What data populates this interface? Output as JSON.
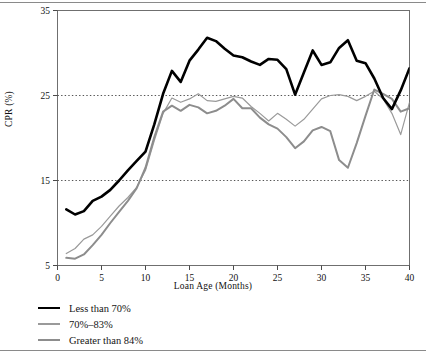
{
  "figure": {
    "background": "#ffffff",
    "frame_color": "#6f6f6f"
  },
  "axes": {
    "ylabel": "CPR (%)",
    "xlabel": "Loan Age (Months)",
    "y_ticks": [
      "5",
      "15",
      "25",
      "35"
    ],
    "x_ticks": [
      "0",
      "5",
      "10",
      "15",
      "20",
      "25",
      "30",
      "35",
      "40"
    ]
  },
  "legend": {
    "items": [
      {
        "label": "Less than 70%",
        "color": "#000000",
        "style": "thick"
      },
      {
        "label": "70%–83%",
        "color": "#9a9a9a",
        "style": "thin"
      },
      {
        "label": "Greater than 84%",
        "color": "#8d8d8d",
        "style": "medium"
      }
    ]
  },
  "chart_data": {
    "type": "line",
    "title": "",
    "xlabel": "Loan Age (Months)",
    "ylabel": "CPR (%)",
    "xlim": [
      0,
      40
    ],
    "ylim": [
      5,
      35
    ],
    "xticks": [
      0,
      5,
      10,
      15,
      20,
      25,
      30,
      35,
      40
    ],
    "yticks": [
      5,
      15,
      25,
      35
    ],
    "gridlines": {
      "y": [
        15,
        25
      ],
      "style": "dotted",
      "color": "#555555"
    },
    "legend_position": "below-axes-left",
    "x": [
      1,
      2,
      3,
      4,
      5,
      6,
      7,
      8,
      9,
      10,
      11,
      12,
      13,
      14,
      15,
      16,
      17,
      18,
      19,
      20,
      21,
      22,
      23,
      24,
      25,
      26,
      27,
      28,
      29,
      30,
      31,
      32,
      33,
      34,
      35,
      36,
      37,
      38,
      39,
      40
    ],
    "series": [
      {
        "name": "Less than 70%",
        "color": "#000000",
        "width": 2.6,
        "values": [
          11.6,
          11.0,
          11.4,
          12.6,
          13.1,
          13.9,
          15.0,
          16.2,
          17.3,
          18.4,
          21.6,
          25.2,
          27.9,
          26.6,
          29.1,
          30.4,
          31.8,
          31.4,
          30.5,
          29.7,
          29.5,
          29.0,
          28.6,
          29.3,
          29.2,
          28.1,
          25.1,
          27.7,
          30.3,
          28.6,
          28.9,
          30.6,
          31.5,
          29.1,
          28.8,
          27.0,
          24.7,
          23.4,
          25.6,
          28.2
        ]
      },
      {
        "name": "70%–83%",
        "color": "#9a9a9a",
        "width": 1.2,
        "values": [
          6.4,
          7.0,
          8.1,
          8.6,
          9.6,
          10.8,
          12.0,
          13.0,
          14.2,
          16.2,
          19.7,
          22.9,
          24.7,
          24.2,
          24.6,
          25.2,
          24.4,
          24.3,
          24.6,
          24.9,
          24.7,
          23.7,
          22.9,
          22.0,
          22.9,
          22.2,
          21.4,
          22.2,
          23.4,
          24.6,
          25.0,
          25.1,
          24.9,
          24.4,
          24.9,
          25.5,
          24.6,
          22.9,
          20.4,
          24.2
        ]
      },
      {
        "name": "Greater than 84%",
        "color": "#8d8d8d",
        "width": 2.0,
        "values": [
          5.9,
          5.8,
          6.3,
          7.4,
          8.6,
          10.0,
          11.3,
          12.6,
          14.1,
          16.5,
          20.1,
          23.1,
          23.8,
          23.2,
          23.9,
          23.6,
          22.9,
          23.2,
          23.8,
          24.6,
          23.5,
          23.5,
          22.4,
          21.6,
          21.1,
          20.1,
          18.8,
          19.6,
          20.9,
          21.3,
          20.8,
          17.4,
          16.5,
          19.4,
          22.6,
          25.7,
          25.2,
          24.6,
          23.1,
          23.5
        ]
      }
    ]
  }
}
